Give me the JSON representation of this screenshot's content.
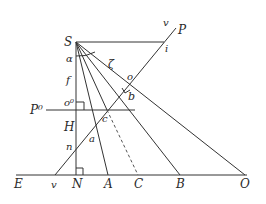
{
  "diagram": {
    "type": "perspective-geometry",
    "colors": {
      "line": "#333333",
      "label": "#2a2a2a",
      "background": "#ffffff"
    },
    "labels": {
      "S": "S",
      "P": "P",
      "v_top": "v",
      "i": "i",
      "zeta": "ζ",
      "o": "o",
      "b": "b",
      "alpha": "α",
      "f": "f",
      "o0": "o⁰",
      "P0": "P⁰",
      "c": "c",
      "H": "H",
      "a": "a",
      "n": "n",
      "E": "E",
      "v_bottom": "v",
      "N": "N",
      "A": "A",
      "C": "C",
      "B": "B",
      "O": "O"
    },
    "points": {
      "S": [
        76,
        42
      ],
      "i": [
        164,
        42
      ],
      "top_end": [
        176,
        28
      ],
      "o": [
        128,
        86
      ],
      "c": [
        107,
        110
      ],
      "o0": [
        76,
        110
      ],
      "v": [
        55,
        175
      ],
      "N": [
        76,
        175
      ],
      "A": [
        108,
        175
      ],
      "C": [
        138,
        175
      ],
      "B": [
        180,
        175
      ],
      "O": [
        245,
        175
      ],
      "ground_start": [
        16,
        175
      ],
      "ground_end": [
        247,
        175
      ],
      "P0_start": [
        46,
        110
      ],
      "P0_end": [
        135,
        110
      ]
    }
  }
}
